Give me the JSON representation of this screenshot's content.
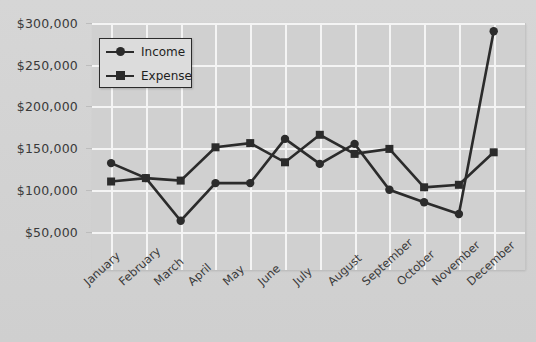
{
  "chart_data": {
    "type": "line",
    "title": "",
    "subtitle": "",
    "xlabel": "",
    "ylabel": "",
    "categories": [
      "January",
      "February",
      "March",
      "April",
      "May",
      "June",
      "July",
      "August",
      "September",
      "October",
      "November",
      "December"
    ],
    "series": [
      {
        "name": "Income",
        "marker": "circle",
        "color": "#2b2b2b",
        "values": [
          132000,
          114000,
          63000,
          108000,
          108000,
          161000,
          131000,
          155000,
          100000,
          85000,
          71000,
          290000
        ]
      },
      {
        "name": "Expense",
        "marker": "square",
        "color": "#2b2b2b",
        "values": [
          110000,
          114000,
          111000,
          151000,
          156000,
          133000,
          166000,
          143000,
          149000,
          103000,
          106000,
          145000
        ]
      }
    ],
    "ylim": [
      25000,
      300000
    ],
    "y_ticks": [
      300000,
      250000,
      200000,
      150000,
      100000,
      50000
    ],
    "y_tick_labels": [
      "$300,000",
      "$250,000",
      "$200,000",
      "$150,000",
      "$100,000",
      "$50,000"
    ],
    "grid": true,
    "grid_color": "#f4f4f4",
    "legend_position": "upper-left",
    "legend_entries": [
      "Income",
      "Expense"
    ],
    "plot_background": "#d0d0d0",
    "figure_background": "#d4d4d4"
  }
}
